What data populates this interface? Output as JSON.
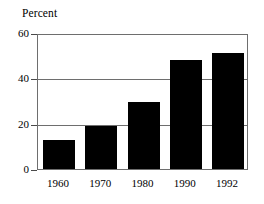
{
  "chart_data": {
    "type": "bar",
    "title": "Percent",
    "xlabel": "",
    "ylabel": "Percent",
    "categories": [
      "1960",
      "1970",
      "1980",
      "1990",
      "1992"
    ],
    "values": [
      13,
      19,
      29.5,
      48,
      51
    ],
    "ylim": [
      0,
      60
    ],
    "yticks": [
      0,
      20,
      40,
      60
    ],
    "ytick_labels": [
      "0",
      "20",
      "40",
      "60"
    ],
    "gridlines_at": [
      20,
      40
    ],
    "grid": true,
    "legend": "none",
    "series": [
      {
        "name": "Percent",
        "values": [
          13,
          19,
          29.5,
          48,
          51
        ],
        "color": "#000000"
      }
    ],
    "colors": {
      "bar": "#000000",
      "frame": "#6e6e6e",
      "gridline": "#6e6e6e",
      "background": "#ffffff",
      "text": "#000000"
    }
  }
}
